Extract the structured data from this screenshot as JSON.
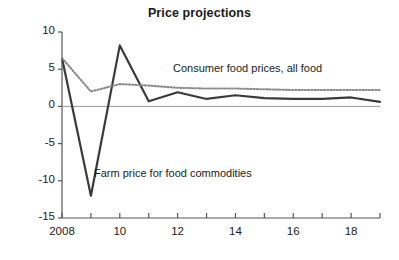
{
  "chart_data": {
    "type": "line",
    "title": "Price projections",
    "xlabel": "",
    "ylabel": "",
    "x": [
      2008,
      2009,
      2010,
      2011,
      2012,
      2013,
      2014,
      2015,
      2016,
      2017,
      2018,
      2019
    ],
    "xlim": [
      2007.6,
      2019.4
    ],
    "ylim": [
      -15,
      10
    ],
    "yticks": [
      10,
      5,
      0,
      -5,
      -10,
      -15
    ],
    "ytick_labels": [
      "10",
      "5",
      "0",
      "-5",
      "-10",
      "-15"
    ],
    "xticks": [
      2008,
      2009,
      2010,
      2011,
      2012,
      2013,
      2014,
      2015,
      2016,
      2017,
      2018,
      2019
    ],
    "xtick_labels_shown": [
      {
        "x": 2008,
        "label": "2008"
      },
      {
        "x": 2010,
        "label": "10"
      },
      {
        "x": 2012,
        "label": "12"
      },
      {
        "x": 2014,
        "label": "14"
      },
      {
        "x": 2016,
        "label": "16"
      },
      {
        "x": 2018,
        "label": "18"
      }
    ],
    "grid": false,
    "zero_line": true,
    "legend_position": "inline-annotations",
    "series": [
      {
        "name": "Farm price for food commodities",
        "style": "solid",
        "color": "#3a3a3a",
        "values": [
          6.5,
          -12.0,
          8.2,
          0.7,
          1.9,
          1.0,
          1.5,
          1.1,
          1.0,
          1.0,
          1.2,
          0.6
        ]
      },
      {
        "name": "Consumer food prices, all food",
        "style": "dotted",
        "color": "#8a8a8a",
        "values": [
          6.5,
          2.0,
          3.0,
          2.8,
          2.5,
          2.4,
          2.4,
          2.3,
          2.2,
          2.2,
          2.2,
          2.2
        ]
      }
    ],
    "annotations": [
      {
        "text": "Consumer food prices, all food",
        "target_series": "Consumer food prices, all food",
        "left": 173,
        "top": 62
      },
      {
        "text": "Farm price for food commodities",
        "target_series": "Farm price for food commodities",
        "left": 94,
        "top": 167
      }
    ]
  },
  "axis_style": {
    "axis_color": "#555555",
    "zero_line_color": "#999999"
  }
}
